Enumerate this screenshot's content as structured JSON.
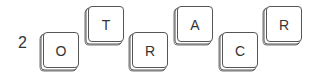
{
  "puzzle": {
    "number": "2",
    "tiles": [
      {
        "letter": "O",
        "position": "low"
      },
      {
        "letter": "T",
        "position": "high"
      },
      {
        "letter": "R",
        "position": "low"
      },
      {
        "letter": "A",
        "position": "high"
      },
      {
        "letter": "C",
        "position": "low"
      },
      {
        "letter": "R",
        "position": "high"
      }
    ]
  }
}
